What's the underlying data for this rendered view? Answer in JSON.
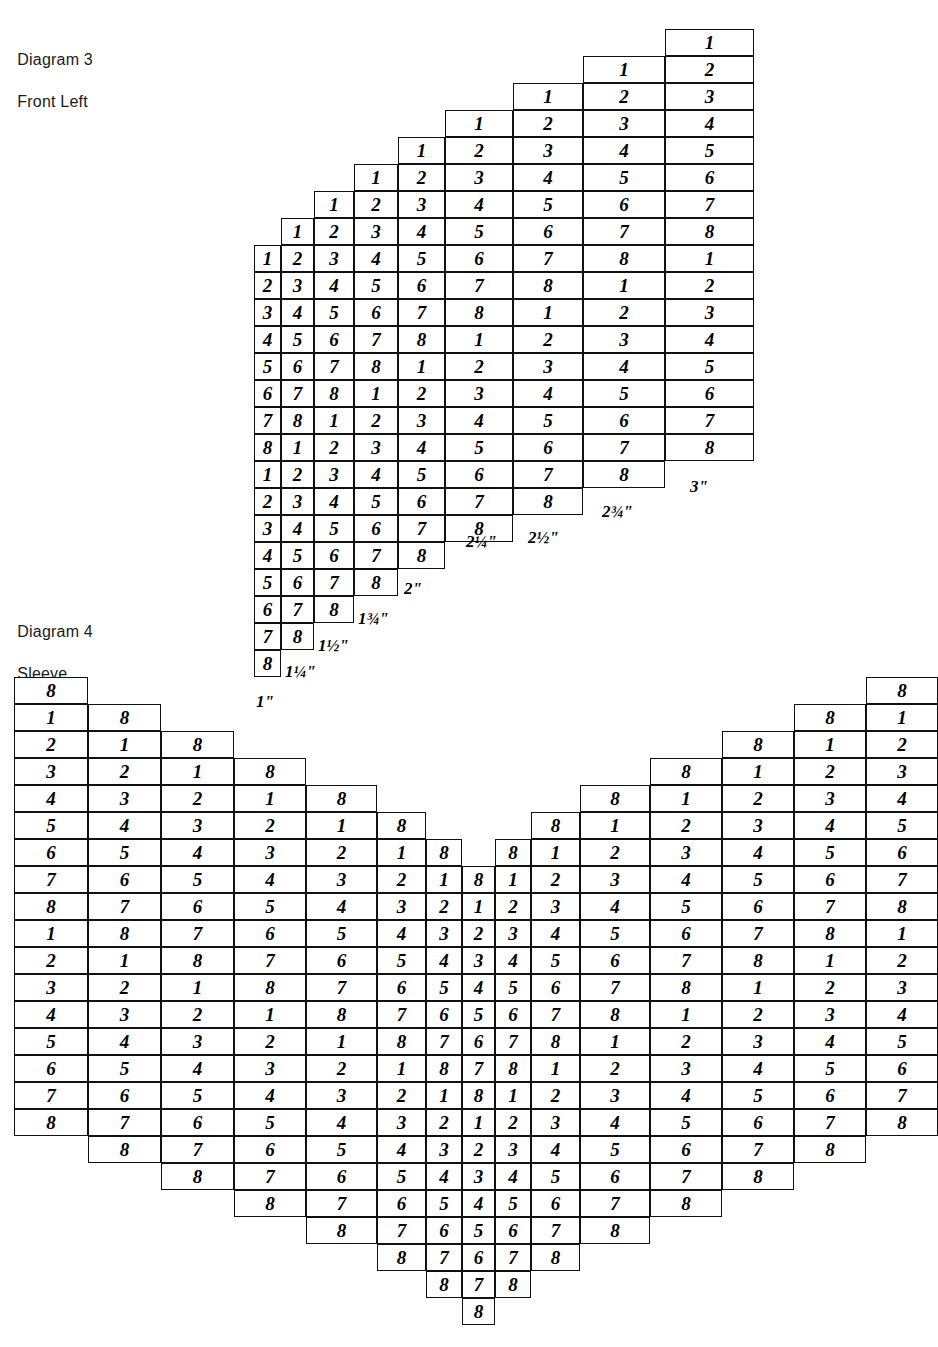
{
  "page": {
    "background_color": "#ffffff",
    "ink_color": "#000000"
  },
  "diagram3": {
    "caption_line1": "Diagram 3",
    "caption_line2": "Front Left",
    "type": "stepped-grid",
    "columns": 9,
    "rows": 25,
    "col_widths": [
      27,
      33,
      40,
      44,
      47,
      68,
      70,
      82,
      89
    ],
    "row_height": 27,
    "origin_x": 254,
    "origin_y": 29,
    "description": "Stepped shoulder grid; each column to the right starts one row higher and ends one row lower.",
    "column_top_row": [
      8,
      7,
      6,
      5,
      4,
      3,
      2,
      1,
      0
    ],
    "column_bottom_row": [
      24,
      23,
      22,
      21,
      20,
      19,
      18,
      17,
      16
    ],
    "cell_sequence_start_value": 1,
    "cell_cycle": [
      1,
      2,
      3,
      4,
      5,
      6,
      7,
      8
    ],
    "grid": [
      [
        null,
        null,
        null,
        null,
        null,
        null,
        null,
        null,
        "1"
      ],
      [
        null,
        null,
        null,
        null,
        null,
        null,
        null,
        "1",
        "2"
      ],
      [
        null,
        null,
        null,
        null,
        null,
        null,
        "1",
        "2",
        "3"
      ],
      [
        null,
        null,
        null,
        null,
        null,
        "1",
        "2",
        "3",
        "4"
      ],
      [
        null,
        null,
        null,
        null,
        "1",
        "2",
        "3",
        "4",
        "5"
      ],
      [
        null,
        null,
        null,
        "1",
        "2",
        "3",
        "4",
        "5",
        "6"
      ],
      [
        null,
        null,
        "1",
        "2",
        "3",
        "4",
        "5",
        "6",
        "7"
      ],
      [
        null,
        "1",
        "2",
        "3",
        "4",
        "5",
        "6",
        "7",
        "8"
      ],
      [
        "1",
        "2",
        "3",
        "4",
        "5",
        "6",
        "7",
        "8",
        "1"
      ],
      [
        "2",
        "3",
        "4",
        "5",
        "6",
        "7",
        "8",
        "1",
        "2"
      ],
      [
        "3",
        "4",
        "5",
        "6",
        "7",
        "8",
        "1",
        "2",
        "3"
      ],
      [
        "4",
        "5",
        "6",
        "7",
        "8",
        "1",
        "2",
        "3",
        "4"
      ],
      [
        "5",
        "6",
        "7",
        "8",
        "1",
        "2",
        "3",
        "4",
        "5"
      ],
      [
        "6",
        "7",
        "8",
        "1",
        "2",
        "3",
        "4",
        "5",
        "6"
      ],
      [
        "7",
        "8",
        "1",
        "2",
        "3",
        "4",
        "5",
        "6",
        "7"
      ],
      [
        "8",
        "1",
        "2",
        "3",
        "4",
        "5",
        "6",
        "7",
        "8"
      ],
      [
        "1",
        "2",
        "3",
        "4",
        "5",
        "6",
        "7",
        "8",
        null
      ],
      [
        "2",
        "3",
        "4",
        "5",
        "6",
        "7",
        "8",
        null,
        null
      ],
      [
        "3",
        "4",
        "5",
        "6",
        "7",
        "8",
        null,
        null,
        null
      ],
      [
        "4",
        "5",
        "6",
        "7",
        "8",
        null,
        null,
        null,
        null
      ],
      [
        "5",
        "6",
        "7",
        "8",
        null,
        null,
        null,
        null,
        null
      ],
      [
        "6",
        "7",
        "8",
        null,
        null,
        null,
        null,
        null,
        null
      ],
      [
        "7",
        "8",
        null,
        null,
        null,
        null,
        null,
        null,
        null
      ],
      [
        "8",
        null,
        null,
        null,
        null,
        null,
        null,
        null,
        null
      ]
    ],
    "measurements": [
      {
        "label": "1\"",
        "x": 256,
        "y": 693
      },
      {
        "label": "1¼\"",
        "x": 285,
        "y": 663
      },
      {
        "label": "1½\"",
        "x": 318,
        "y": 637
      },
      {
        "label": "1¾\"",
        "x": 358,
        "y": 610
      },
      {
        "label": "2\"",
        "x": 404,
        "y": 580
      },
      {
        "label": "2¼\"",
        "x": 466,
        "y": 533
      },
      {
        "label": "2½\"",
        "x": 528,
        "y": 529
      },
      {
        "label": "2¾\"",
        "x": 602,
        "y": 503
      },
      {
        "label": "3\"",
        "x": 690,
        "y": 478
      }
    ]
  },
  "diagram4": {
    "caption_line1": "Diagram 4",
    "caption_line2": "Sleeve",
    "type": "symmetric-v-grid",
    "columns": 15,
    "rows": 25,
    "col_widths": [
      74,
      73,
      73,
      72,
      71,
      49,
      36,
      33,
      36,
      49,
      70,
      72,
      72,
      72,
      72
    ],
    "row_height": 27,
    "origin_x": 14,
    "origin_y": 677,
    "description": "Symmetric sleeve cap grid. Columns step down toward the centre forming a V-neck notch at the top, and the lower edge tapers to a single cell at the bottom centre.",
    "column_top_row": [
      0,
      1,
      2,
      3,
      4,
      5,
      6,
      7,
      6,
      5,
      4,
      3,
      2,
      1,
      0
    ],
    "column_bottom_row": [
      16,
      17,
      18,
      19,
      20,
      21,
      22,
      23,
      22,
      21,
      20,
      19,
      18,
      17,
      16
    ],
    "grid": [
      [
        "8",
        null,
        null,
        null,
        null,
        null,
        null,
        null,
        null,
        null,
        null,
        null,
        null,
        null,
        "8"
      ],
      [
        "1",
        "8",
        null,
        null,
        null,
        null,
        null,
        null,
        null,
        null,
        null,
        null,
        null,
        "8",
        "1"
      ],
      [
        "2",
        "1",
        "8",
        null,
        null,
        null,
        null,
        null,
        null,
        null,
        null,
        null,
        "8",
        "1",
        "2"
      ],
      [
        "3",
        "2",
        "1",
        "8",
        null,
        null,
        null,
        null,
        null,
        null,
        null,
        "8",
        "1",
        "2",
        "3"
      ],
      [
        "4",
        "3",
        "2",
        "1",
        "8",
        null,
        null,
        null,
        null,
        null,
        "8",
        "1",
        "2",
        "3",
        "4"
      ],
      [
        "5",
        "4",
        "3",
        "2",
        "1",
        "8",
        null,
        null,
        null,
        "8",
        "1",
        "2",
        "3",
        "4",
        "5"
      ],
      [
        "6",
        "5",
        "4",
        "3",
        "2",
        "1",
        "8",
        null,
        "8",
        "1",
        "2",
        "3",
        "4",
        "5",
        "6"
      ],
      [
        "7",
        "6",
        "5",
        "4",
        "3",
        "2",
        "1",
        "8",
        "1",
        "2",
        "3",
        "4",
        "5",
        "6",
        "7"
      ],
      [
        "8",
        "7",
        "6",
        "5",
        "4",
        "3",
        "2",
        "1",
        "2",
        "3",
        "4",
        "5",
        "6",
        "7",
        "8"
      ],
      [
        "1",
        "8",
        "7",
        "6",
        "5",
        "4",
        "3",
        "2",
        "3",
        "4",
        "5",
        "6",
        "7",
        "8",
        "1"
      ],
      [
        "2",
        "1",
        "8",
        "7",
        "6",
        "5",
        "4",
        "3",
        "4",
        "5",
        "6",
        "7",
        "8",
        "1",
        "2"
      ],
      [
        "3",
        "2",
        "1",
        "8",
        "7",
        "6",
        "5",
        "4",
        "5",
        "6",
        "7",
        "8",
        "1",
        "2",
        "3"
      ],
      [
        "4",
        "3",
        "2",
        "1",
        "8",
        "7",
        "6",
        "5",
        "6",
        "7",
        "8",
        "1",
        "2",
        "3",
        "4"
      ],
      [
        "5",
        "4",
        "3",
        "2",
        "1",
        "8",
        "7",
        "6",
        "7",
        "8",
        "1",
        "2",
        "3",
        "4",
        "5"
      ],
      [
        "6",
        "5",
        "4",
        "3",
        "2",
        "1",
        "8",
        "7",
        "8",
        "1",
        "2",
        "3",
        "4",
        "5",
        "6"
      ],
      [
        "7",
        "6",
        "5",
        "4",
        "3",
        "2",
        "1",
        "8",
        "1",
        "2",
        "3",
        "4",
        "5",
        "6",
        "7"
      ],
      [
        "8",
        "7",
        "6",
        "5",
        "4",
        "3",
        "2",
        "1",
        "2",
        "3",
        "4",
        "5",
        "6",
        "7",
        "8"
      ],
      [
        null,
        "8",
        "7",
        "6",
        "5",
        "4",
        "3",
        "2",
        "3",
        "4",
        "5",
        "6",
        "7",
        "8",
        null
      ],
      [
        null,
        null,
        "8",
        "7",
        "6",
        "5",
        "4",
        "3",
        "4",
        "5",
        "6",
        "7",
        "8",
        null,
        null
      ],
      [
        null,
        null,
        null,
        "8",
        "7",
        "6",
        "5",
        "4",
        "5",
        "6",
        "7",
        "8",
        null,
        null,
        null
      ],
      [
        null,
        null,
        null,
        null,
        "8",
        "7",
        "6",
        "5",
        "6",
        "7",
        "8",
        null,
        null,
        null,
        null
      ],
      [
        null,
        null,
        null,
        null,
        null,
        "8",
        "7",
        "6",
        "7",
        "8",
        null,
        null,
        null,
        null,
        null
      ],
      [
        null,
        null,
        null,
        null,
        null,
        null,
        "8",
        "7",
        "8",
        null,
        null,
        null,
        null,
        null,
        null
      ],
      [
        null,
        null,
        null,
        null,
        null,
        null,
        null,
        "8",
        null,
        null,
        null,
        null,
        null,
        null,
        null
      ]
    ]
  }
}
